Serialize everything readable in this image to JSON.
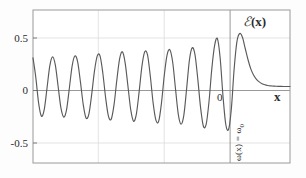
{
  "figure": {
    "background_color": "#fdfdfd",
    "frame_color": "#9a9a9a",
    "grid_color": "#d9d9d9",
    "curve_color": "#5a5a5a",
    "text_color": "#2b2b2b"
  },
  "labels": {
    "curve_label_symbol": "ℰ",
    "curve_label_arg": "(x)",
    "x_axis_name": "x",
    "annotation_rotated": "ω(x) = ω",
    "annotation_rotated_sub": "0"
  },
  "axes": {
    "y_ticks": [
      "0.5",
      "0",
      "-0.5"
    ],
    "x_ticks": [
      "0"
    ]
  },
  "chart_data": {
    "type": "line",
    "title": "",
    "xlabel": "x",
    "ylabel": "ℰ(x)",
    "xlim": [
      -11.2,
      2.6
    ],
    "ylim": [
      -0.75,
      0.75
    ],
    "grid": true,
    "legend": null,
    "annotations": [
      {
        "text": "ω(x) = ω₀",
        "x": 0.18,
        "y": -0.33,
        "rotation": 90
      },
      {
        "text": "ℰ(x)",
        "x": 0.55,
        "y": 0.63,
        "rotation": 0
      }
    ],
    "x_tick_values": [
      0
    ],
    "y_tick_values": [
      0.5,
      0,
      -0.5
    ],
    "x_gridlines": [
      -7.1,
      -3.55,
      0
    ],
    "y_gridlines": [
      0.5,
      0,
      -0.5
    ],
    "series": [
      {
        "name": "ℰ(x)",
        "x": [
          -11.2,
          -11.05,
          -10.9,
          -10.75,
          -10.6,
          -10.45,
          -10.3,
          -10.15,
          -10.0,
          -9.85,
          -9.7,
          -9.55,
          -9.4,
          -9.25,
          -9.1,
          -8.95,
          -8.8,
          -8.65,
          -8.5,
          -8.35,
          -8.2,
          -8.05,
          -7.9,
          -7.75,
          -7.6,
          -7.45,
          -7.3,
          -7.15,
          -7.0,
          -6.85,
          -6.7,
          -6.55,
          -6.4,
          -6.25,
          -6.1,
          -5.95,
          -5.8,
          -5.65,
          -5.5,
          -5.35,
          -5.2,
          -5.05,
          -4.9,
          -4.75,
          -4.6,
          -4.45,
          -4.3,
          -4.15,
          -4.0,
          -3.85,
          -3.7,
          -3.55,
          -3.4,
          -3.25,
          -3.1,
          -2.95,
          -2.8,
          -2.65,
          -2.5,
          -2.35,
          -2.2,
          -2.05,
          -1.9,
          -1.75,
          -1.6,
          -1.45,
          -1.3,
          -1.15,
          -1.0,
          -0.85,
          -0.7,
          -0.55,
          -0.4,
          -0.25,
          -0.1,
          0.05,
          0.2,
          0.35,
          0.5,
          0.65,
          0.8,
          0.95,
          1.1,
          1.25,
          1.4,
          1.55,
          1.7,
          1.85,
          2.0,
          2.15,
          2.3,
          2.45,
          2.6
        ],
        "y": [
          0.28,
          0.09,
          -0.16,
          -0.29,
          -0.23,
          -0.02,
          0.2,
          0.29,
          0.21,
          0.0,
          -0.21,
          -0.3,
          -0.23,
          -0.02,
          0.2,
          0.3,
          0.24,
          0.04,
          -0.18,
          -0.31,
          -0.27,
          -0.08,
          0.15,
          0.3,
          0.3,
          0.13,
          -0.11,
          -0.29,
          -0.32,
          -0.18,
          0.06,
          0.27,
          0.34,
          0.23,
          0.0,
          -0.23,
          -0.34,
          -0.27,
          -0.05,
          0.2,
          0.34,
          0.31,
          0.1,
          -0.16,
          -0.33,
          -0.34,
          -0.16,
          0.11,
          0.31,
          0.36,
          0.24,
          -0.02,
          -0.27,
          -0.37,
          -0.28,
          -0.02,
          0.26,
          0.38,
          0.31,
          0.07,
          -0.21,
          -0.39,
          -0.37,
          -0.15,
          0.17,
          0.4,
          0.47,
          0.28,
          -0.09,
          -0.37,
          -0.42,
          -0.22,
          0.17,
          0.44,
          0.52,
          0.48,
          0.37,
          0.26,
          0.17,
          0.11,
          0.07,
          0.045,
          0.028,
          0.017,
          0.01,
          0.006,
          0.004,
          0.002,
          0.001,
          0.001,
          0.0,
          0.0,
          0.0
        ]
      }
    ]
  }
}
